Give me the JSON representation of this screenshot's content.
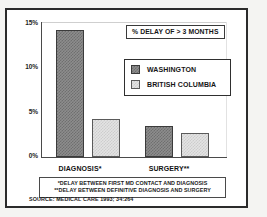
{
  "chart_data": {
    "type": "bar",
    "title": "% DELAY OF > 3 MONTHS",
    "xlabel": "",
    "ylabel": "",
    "ylim": [
      0,
      15
    ],
    "grid": false,
    "legend_position": "upper-right",
    "categories": [
      "DIAGNOSIS*",
      "SURGERY**"
    ],
    "ytick_labels": [
      "0%",
      "5%",
      "10%",
      "15%"
    ],
    "ytick_values": [
      0,
      5,
      10,
      15
    ],
    "series": [
      {
        "name": "WASHINGTON",
        "values": [
          14.0,
          3.4
        ]
      },
      {
        "name": "BRITISH COLUMBIA",
        "values": [
          4.2,
          2.6
        ]
      }
    ],
    "annotations": [
      "*DELAY BETWEEN FIRST MD CONTACT AND DIAGNOSIS",
      "**DELAY BETWEEN DEFINITIVE DIAGNOSIS AND SURGERY"
    ],
    "source": "SOURCE: MEDICAL CARE 1993; 34:264",
    "colors": {
      "washington": "#8d8d8d",
      "british_columbia": "#e3e3e3",
      "axis": "#4a4a4a",
      "frame": "#2b2b2b",
      "text": "#151515"
    }
  }
}
